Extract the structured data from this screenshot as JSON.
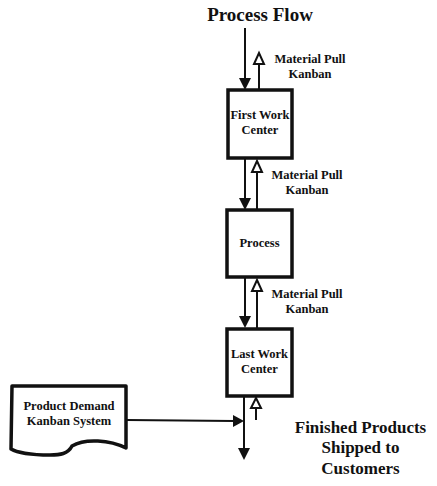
{
  "diagram": {
    "title": "Process Flow",
    "nodes": [
      {
        "id": "first",
        "label_line1": "First Work",
        "label_line2": "Center"
      },
      {
        "id": "process",
        "label_line1": "Process"
      },
      {
        "id": "last",
        "label_line1": "Last Work",
        "label_line2": "Center"
      },
      {
        "id": "demand",
        "label_line1": "Product Demand",
        "label_line2": "Kanban System",
        "shape": "document"
      }
    ],
    "kanban_labels": [
      {
        "line1": "Material Pull",
        "line2": "Kanban"
      },
      {
        "line1": "Material Pull",
        "line2": "Kanban"
      },
      {
        "line1": "Material Pull",
        "line2": "Kanban"
      }
    ],
    "output": {
      "line1": "Finished Products",
      "line2": "Shipped to",
      "line3": "Customers"
    },
    "colors": {
      "stroke": "#111111",
      "background": "#ffffff"
    }
  }
}
